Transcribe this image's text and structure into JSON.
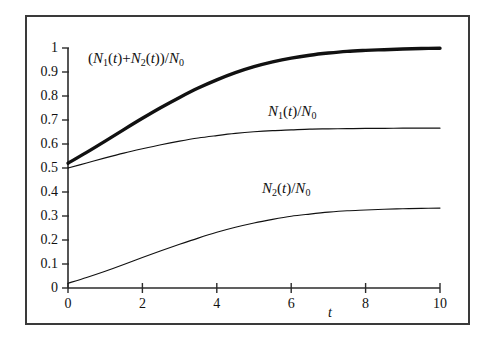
{
  "figure": {
    "background_color": "#ffffff",
    "frame_color": "#3a3a3a",
    "curve_color": "#111111"
  },
  "chart_data": {
    "type": "line",
    "title": "",
    "xlabel": "t",
    "ylabel": "",
    "xlim": [
      0,
      10
    ],
    "ylim": [
      0,
      1
    ],
    "grid": false,
    "legend": "inline-annotations",
    "xticks": [
      0,
      2,
      4,
      6,
      8,
      10
    ],
    "xtick_labels": [
      "0",
      "2",
      "4",
      "6",
      "8",
      "10"
    ],
    "yticks": [
      0,
      0.1,
      0.2,
      0.3,
      0.4,
      0.5,
      0.6,
      0.7,
      0.8,
      0.9,
      1
    ],
    "ytick_labels": [
      "0",
      "0.1",
      "0.2",
      "0.3",
      "0.4",
      "0.5",
      "0.6",
      "0.7",
      "0.8",
      "0.9",
      "1"
    ],
    "x": [
      0,
      0.5,
      1,
      1.5,
      2,
      2.5,
      3,
      3.5,
      4,
      4.5,
      5,
      5.5,
      6,
      6.5,
      7,
      7.5,
      8,
      8.5,
      9,
      9.5,
      10
    ],
    "series": [
      {
        "name": "(N1(t)+N2(t))/N0",
        "label_text": "(N₁(t)+N₂(t))/N₀",
        "linewidth": "thick",
        "values": [
          0.52,
          0.565,
          0.612,
          0.66,
          0.707,
          0.752,
          0.794,
          0.833,
          0.867,
          0.897,
          0.922,
          0.942,
          0.958,
          0.97,
          0.979,
          0.986,
          0.99,
          0.993,
          0.996,
          0.998,
          0.999
        ]
      },
      {
        "name": "N1(t)/N0",
        "label_text": "N₁(t)/N₀",
        "linewidth": "thin",
        "values": [
          0.5,
          0.521,
          0.542,
          0.562,
          0.58,
          0.597,
          0.612,
          0.625,
          0.635,
          0.644,
          0.651,
          0.656,
          0.659,
          0.662,
          0.663,
          0.664,
          0.665,
          0.665,
          0.666,
          0.666,
          0.666
        ]
      },
      {
        "name": "N2(t)/N0",
        "label_text": "N₂(t)/N₀",
        "linewidth": "thin",
        "values": [
          0.02,
          0.044,
          0.07,
          0.098,
          0.127,
          0.155,
          0.182,
          0.208,
          0.232,
          0.253,
          0.271,
          0.286,
          0.299,
          0.308,
          0.316,
          0.322,
          0.325,
          0.328,
          0.33,
          0.332,
          0.333
        ]
      }
    ],
    "annotations": [
      {
        "name": "sum-curve-label",
        "text": "(N₁(t)+N₂(t))/N₀",
        "x_px": 88,
        "y_px": 50
      },
      {
        "name": "n1-curve-label",
        "text": "N₁(t)/N₀",
        "x_px": 268,
        "y_px": 103
      },
      {
        "name": "n2-curve-label",
        "text": "N₂(t)/N₀",
        "x_px": 262,
        "y_px": 180
      },
      {
        "name": "x-axis-title",
        "text": "t",
        "x_px": 328,
        "y_px": 308
      }
    ]
  }
}
